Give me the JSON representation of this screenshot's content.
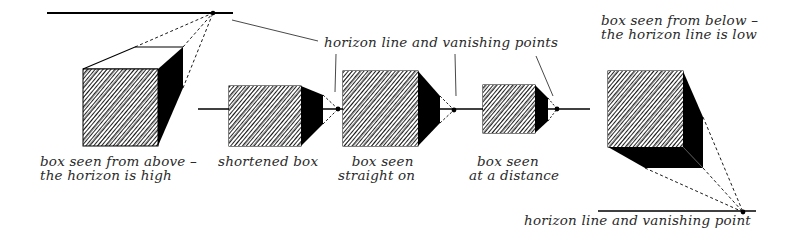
{
  "figure": {
    "colors": {
      "ink": "#000000",
      "text": "#2a2a2a",
      "background": "#ffffff"
    }
  },
  "labels": {
    "box_above": {
      "line1": "box seen from above –",
      "line2": "the horizon is high"
    },
    "shortened_box": "shortened box",
    "box_straight": {
      "line1": "box seen",
      "line2": "straight on"
    },
    "box_distance": {
      "line1": "box seen",
      "line2": "at a distance"
    },
    "box_below": {
      "line1": "box seen from below –",
      "line2": "the horizon line is low"
    },
    "horizon_points": "horizon line and vanishing points",
    "horizon_point": "horizon line and vanishing point"
  },
  "diagram": {
    "boxes": [
      {
        "id": "box-above",
        "view": "from above",
        "horizon": "high"
      },
      {
        "id": "shortened-box",
        "view": "shortened"
      },
      {
        "id": "box-straight-on",
        "view": "straight on"
      },
      {
        "id": "box-at-distance",
        "view": "at a distance"
      },
      {
        "id": "box-below",
        "view": "from below",
        "horizon": "low"
      }
    ],
    "horizon_lines": [
      "top-high",
      "middle",
      "bottom-low"
    ],
    "vanishing_points": 5
  }
}
